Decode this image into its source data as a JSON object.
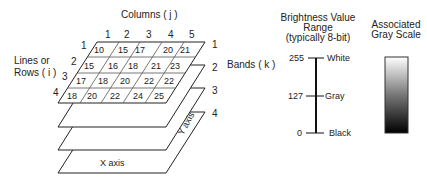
{
  "columns_title": "Columns ( j )",
  "rows_title_line1": "Lines or",
  "rows_title_line2": "Rows ( i )",
  "bands_title": "Bands ( k )",
  "column_indices": [
    "1",
    "2",
    "3",
    "4",
    "5"
  ],
  "row_indices": [
    "1",
    "2",
    "3",
    "4"
  ],
  "band_indices": [
    "1",
    "2",
    "3",
    "4"
  ],
  "grid_values": [
    [
      "10",
      "15",
      "17",
      "20",
      "21"
    ],
    [
      "15",
      "16",
      "18",
      "21",
      "23"
    ],
    [
      "17",
      "18",
      "20",
      "22",
      "22"
    ],
    [
      "18",
      "20",
      "22",
      "24",
      "25"
    ]
  ],
  "x_axis_label": "X axis",
  "y_axis_label": "Y axis",
  "brightness": {
    "title_line1": "Brightness Value",
    "title_line2": "Range",
    "title_line3": "(typically 8-bit)",
    "ticks": [
      {
        "value": "255",
        "label": "White"
      },
      {
        "value": "127",
        "label": "Gray"
      },
      {
        "value": "0",
        "label": "Black"
      }
    ]
  },
  "grayscale": {
    "title_line1": "Associated",
    "title_line2": "Gray Scale",
    "top_color": "#ffffff",
    "bottom_color": "#000000"
  }
}
